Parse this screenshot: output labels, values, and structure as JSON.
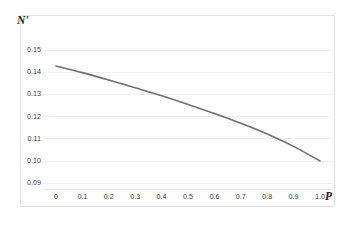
{
  "chart_data": {
    "type": "line",
    "title": "",
    "subtitle": "",
    "xlabel": "P",
    "ylabel": "N'",
    "xlim": [
      0,
      1.0
    ],
    "ylim": [
      0.09,
      0.155
    ],
    "grid": true,
    "grid_axis": "y",
    "legend": false,
    "legend_position": "none",
    "series": [
      {
        "name": "N'(P)",
        "color": "#6f6f6f",
        "line_width": 1.6,
        "x": [
          0.0,
          0.1,
          0.2,
          0.3,
          0.4,
          0.5,
          0.6,
          0.7,
          0.8,
          0.9,
          1.0
        ],
        "values": [
          0.1428,
          0.1398,
          0.1365,
          0.133,
          0.1294,
          0.1255,
          0.1214,
          0.117,
          0.1122,
          0.1066,
          0.1
        ]
      }
    ],
    "x_ticks": [
      "0",
      "0.1",
      "0.2",
      "0.3",
      "0.4",
      "0.5",
      "0.6",
      "0.7",
      "0.8",
      "0.9",
      "1.0"
    ],
    "x_tick_values": [
      0.0,
      0.1,
      0.2,
      0.3,
      0.4,
      0.5,
      0.6,
      0.7,
      0.8,
      0.9,
      1.0
    ],
    "y_ticks": [
      "0.15",
      "0.14",
      "0.13",
      "0.12",
      "0.11",
      "0.10",
      "0.09"
    ],
    "y_tick_values": [
      0.15,
      0.14,
      0.13,
      0.12,
      0.11,
      0.1,
      0.09
    ],
    "annotations": []
  },
  "style": {
    "background": "#ffffff",
    "frame_color": "#e3e3e3",
    "gridline_color": "#efefef",
    "axis_line_color": "#e8e8e8",
    "tick_label_color": "#3d3d3d",
    "axis_title_color": "#1a1a1a",
    "curve_color": "#6f6f6f"
  }
}
